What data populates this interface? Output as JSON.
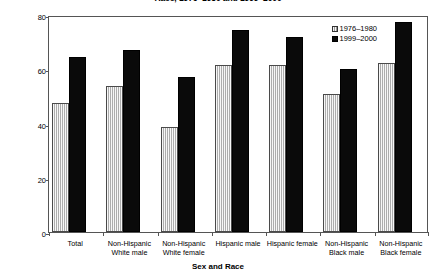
{
  "chart_data": {
    "type": "bar",
    "title": "Race, 1976–1980 and 1999–2000",
    "xlabel": "Sex and Race",
    "ylabel": "Percent",
    "ylim": [
      0,
      80
    ],
    "yticks": [
      0,
      20,
      40,
      60,
      80
    ],
    "grid": false,
    "legend_position": "top-right",
    "categories": [
      "Total",
      "Non-Hispanic\nWhite male",
      "Non-Hispanic\nWhite female",
      "Hispanic male",
      "Hispanic female",
      "Non-Hispanic\nBlack male",
      "Non-Hispanic\nBlack female"
    ],
    "series": [
      {
        "name": "1976–1980",
        "color": "#c9c9c9",
        "values": [
          47.5,
          54.0,
          38.6,
          61.5,
          61.5,
          51.0,
          62.3
        ]
      },
      {
        "name": "1999–2000",
        "color": "#0a0a0a",
        "values": [
          64.5,
          67.2,
          57.0,
          74.5,
          71.8,
          60.0,
          77.5
        ]
      }
    ]
  },
  "axis": {
    "y_tick_labels": [
      "0",
      "20",
      "40",
      "60",
      "80"
    ]
  }
}
